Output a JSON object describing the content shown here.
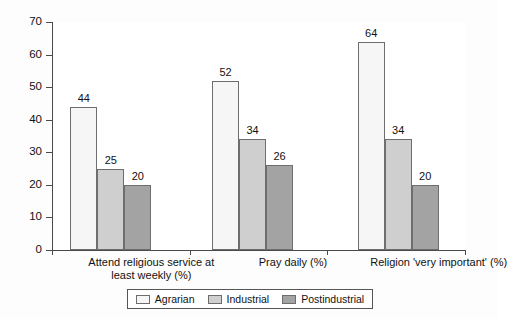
{
  "chart_data": {
    "type": "bar",
    "title": "",
    "subtitle": "",
    "xlabel": "",
    "ylabel": "",
    "ylim": [
      0,
      70
    ],
    "ytick_values": [
      0,
      10,
      20,
      30,
      40,
      50,
      60,
      70
    ],
    "ytick_labels": [
      "0",
      "10",
      "20",
      "30",
      "40",
      "50",
      "60",
      "70"
    ],
    "grid": false,
    "legend_position": "bottom",
    "categories": [
      "Attend religious service at least weekly (%)",
      "Pray daily (%)",
      "Religion 'very important' (%)"
    ],
    "series": [
      {
        "name": "Agrarian",
        "color": "#f6f6f6",
        "values": [
          44,
          52,
          64
        ]
      },
      {
        "name": "Industrial",
        "color": "#cfcfcf",
        "values": [
          25,
          34,
          34
        ]
      },
      {
        "name": "Postindustrial",
        "color": "#a3a3a3",
        "values": [
          20,
          26,
          20
        ]
      }
    ],
    "data_labels": [
      [
        "44",
        "25",
        "20"
      ],
      [
        "52",
        "34",
        "26"
      ],
      [
        "64",
        "34",
        "20"
      ]
    ]
  },
  "legend": {
    "items": [
      {
        "label": "Agrarian"
      },
      {
        "label": "Industrial"
      },
      {
        "label": "Postindustrial"
      }
    ]
  }
}
